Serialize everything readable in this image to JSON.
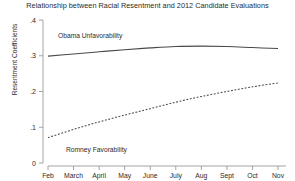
{
  "chart_data": {
    "type": "line",
    "title": "Relationship between Racial Resentment and 2012 Candidate Evaluations",
    "xlabel": "",
    "ylabel": "Resentment Coefficients",
    "categories": [
      "Feb",
      "March",
      "April",
      "May",
      "June",
      "July",
      "Aug",
      "Sept",
      "Oct",
      "Nov"
    ],
    "xtick_labels": [
      "Feb",
      "March",
      "April",
      "May",
      "June",
      "July",
      "Aug",
      "Sept",
      "Oct",
      "Nov"
    ],
    "ytick_labels": [
      "0",
      ".1",
      ".2",
      ".3",
      ".4"
    ],
    "ytick_values": [
      0,
      0.1,
      0.2,
      0.3,
      0.4
    ],
    "ylim": [
      0,
      0.4
    ],
    "grid": false,
    "legend_position": "inline-annotations",
    "series": [
      {
        "name": "Obama Unfavorability",
        "style": "solid",
        "color": "#4a4a4a",
        "values": [
          0.299,
          0.305,
          0.311,
          0.317,
          0.322,
          0.326,
          0.327,
          0.326,
          0.323,
          0.32
        ]
      },
      {
        "name": "Romney Favorability",
        "style": "dashed",
        "color": "#4a4a4a",
        "values": [
          0.071,
          0.094,
          0.115,
          0.134,
          0.152,
          0.17,
          0.186,
          0.2,
          0.213,
          0.224
        ]
      }
    ],
    "annotations": [
      {
        "text": "Obama Unfavorability",
        "series": "Obama Unfavorability"
      },
      {
        "text": "Romney Favorability",
        "series": "Romney Favorability"
      }
    ]
  }
}
